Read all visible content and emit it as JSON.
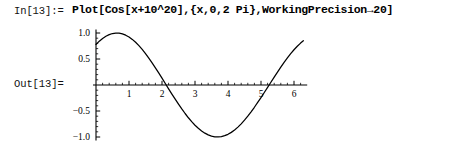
{
  "notebook": {
    "input": {
      "prompt": "In[13]:=",
      "expression": "Plot[Cos[x+10^20],{x,0,2 Pi},WorkingPrecision→20]"
    },
    "output": {
      "prompt": "Out[13]="
    }
  },
  "chart_data": {
    "type": "line",
    "title": "",
    "subtitle": "",
    "xlabel": "",
    "ylabel": "",
    "function": "Cos[x + 10^20]",
    "xlim": [
      0,
      6.4
    ],
    "ylim": [
      -1.05,
      1.05
    ],
    "grid": false,
    "legend": null,
    "legend_position": "none",
    "axes_style": "cross-origin",
    "line_color": "#000000",
    "axis_color": "#000000",
    "xticks": [
      1,
      2,
      3,
      4,
      5,
      6
    ],
    "xtick_labels": [
      "1",
      "2",
      "3",
      "4",
      "5",
      "6"
    ],
    "yticks": [
      -1.0,
      -0.5,
      0.5,
      1.0
    ],
    "ytick_labels": [
      "-1.0",
      "-0.5",
      "0.5",
      "1.0"
    ],
    "x_minor_tick_step": 0.2,
    "y_minor_tick_step": 0.1,
    "series": [
      {
        "name": "Cos[x+10^20]",
        "x": [
          0.0,
          0.1,
          0.2,
          0.3,
          0.4,
          0.5,
          0.6,
          0.7,
          0.8,
          0.9,
          1.0,
          1.1,
          1.2,
          1.3,
          1.4,
          1.5,
          1.6,
          1.7,
          1.8,
          1.9,
          2.0,
          2.1,
          2.2,
          2.3,
          2.4,
          2.5,
          2.6,
          2.7,
          2.8,
          2.9,
          3.0,
          3.1,
          3.2,
          3.3,
          3.4,
          3.5,
          3.6,
          3.7,
          3.8,
          3.9,
          4.0,
          4.1,
          4.2,
          4.3,
          4.4,
          4.5,
          4.6,
          4.7,
          4.8,
          4.9,
          5.0,
          5.1,
          5.2,
          5.3,
          5.4,
          5.5,
          5.6,
          5.7,
          5.8,
          5.9,
          6.0,
          6.1,
          6.2,
          6.283
        ],
        "y": [
          0.78,
          0.843,
          0.896,
          0.938,
          0.969,
          0.99,
          0.999,
          0.997,
          0.983,
          0.958,
          0.923,
          0.877,
          0.821,
          0.757,
          0.684,
          0.604,
          0.518,
          0.427,
          0.331,
          0.232,
          0.131,
          0.029,
          -0.073,
          -0.174,
          -0.273,
          -0.369,
          -0.461,
          -0.548,
          -0.63,
          -0.705,
          -0.773,
          -0.833,
          -0.884,
          -0.926,
          -0.959,
          -0.982,
          -0.996,
          -0.999,
          -0.992,
          -0.975,
          -0.948,
          -0.911,
          -0.865,
          -0.81,
          -0.747,
          -0.676,
          -0.599,
          -0.516,
          -0.428,
          -0.336,
          -0.241,
          -0.144,
          -0.046,
          0.053,
          0.152,
          0.249,
          0.344,
          0.435,
          0.521,
          0.603,
          0.678,
          0.746,
          0.806,
          0.852
        ],
        "marker": "none",
        "style": "solid"
      }
    ],
    "annotations": {
      "zero_crossings": [
        2.33,
        5.45
      ],
      "maximum": {
        "x": 0.67,
        "y": 1.0
      },
      "minimum": {
        "x": 3.81,
        "y": -1.0
      },
      "y_at_x0": 0.78
    }
  }
}
